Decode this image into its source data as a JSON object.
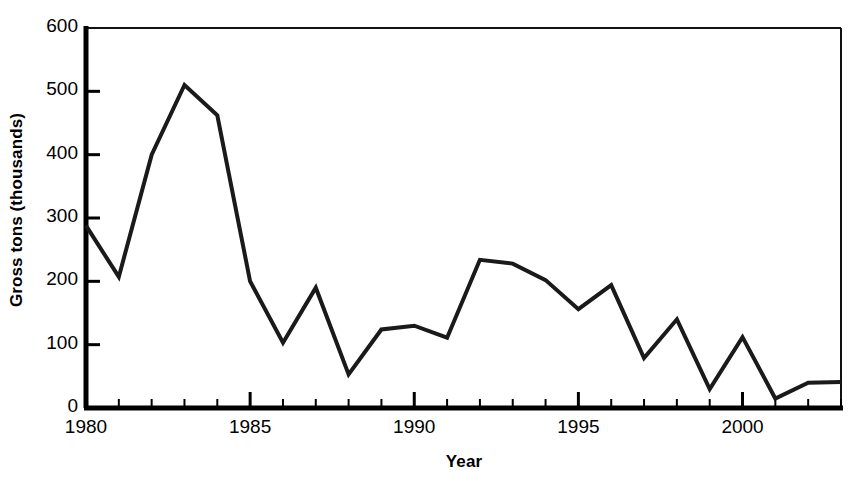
{
  "chart_data": {
    "type": "line",
    "title": "",
    "xlabel": "Year",
    "ylabel": "Gross tons (thousands)",
    "xlim": [
      1980,
      2003
    ],
    "ylim": [
      0,
      600
    ],
    "grid": false,
    "legend": "none",
    "x_ticks_major": [
      1980,
      1985,
      1990,
      1995,
      2000
    ],
    "x_tick_labels": [
      "1980",
      "1985",
      "1990",
      "1995",
      "2000"
    ],
    "x_ticks_minor_every": 1,
    "y_ticks": [
      0,
      100,
      200,
      300,
      400,
      500,
      600
    ],
    "y_tick_labels": [
      "0",
      "100",
      "200",
      "300",
      "400",
      "500",
      "600"
    ],
    "line_color": "#1a1a1a",
    "line_width": 4,
    "x": [
      1980,
      1981,
      1982,
      1983,
      1984,
      1985,
      1986,
      1987,
      1988,
      1989,
      1990,
      1991,
      1992,
      1993,
      1994,
      1995,
      1996,
      1997,
      1998,
      1999,
      2000,
      2001,
      2002,
      2003
    ],
    "values": [
      288,
      207,
      400,
      510,
      462,
      200,
      103,
      190,
      53,
      124,
      130,
      111,
      234,
      228,
      202,
      156,
      194,
      79,
      140,
      30,
      112,
      15,
      40,
      41
    ],
    "series": [
      {
        "name": "Gross tons",
        "values": [
          288,
          207,
          400,
          510,
          462,
          200,
          103,
          190,
          53,
          124,
          130,
          111,
          234,
          228,
          202,
          156,
          194,
          79,
          140,
          30,
          112,
          15,
          40,
          41
        ]
      }
    ]
  },
  "axis": {
    "y_title": "Gross tons (thousands)",
    "x_title": "Year"
  },
  "colors": {
    "line": "#1a1a1a",
    "axis": "#000000",
    "background": "#ffffff"
  }
}
